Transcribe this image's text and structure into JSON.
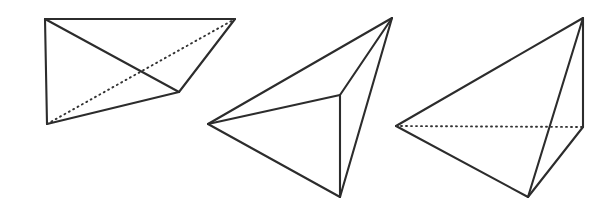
{
  "figure": {
    "caption": "",
    "background_color": "#ffffff",
    "stroke_color": "#2c2c2c",
    "solid_stroke_width": 2.1,
    "hidden_stroke_color": "#333333",
    "hidden_stroke_width": 1.9,
    "hidden_dash_pattern": "1 4",
    "canvas": {
      "width": 614,
      "height": 208
    },
    "shapes": [
      {
        "name": "tetrahedron-left",
        "label": "",
        "vertices": {
          "top_left": [
            45,
            19
          ],
          "top_right": [
            235,
            19
          ],
          "bottom_left": [
            47,
            124
          ],
          "inner_right": [
            179,
            92
          ]
        },
        "solid_edges": [
          [
            [
              45,
              19
            ],
            [
              235,
              19
            ]
          ],
          [
            [
              45,
              19
            ],
            [
              47,
              124
            ]
          ],
          [
            [
              47,
              124
            ],
            [
              179,
              92
            ]
          ],
          [
            [
              179,
              92
            ],
            [
              235,
              19
            ]
          ],
          [
            [
              45,
              19
            ],
            [
              179,
              92
            ]
          ]
        ],
        "hidden_edges": [
          [
            [
              47,
              124
            ],
            [
              235,
              19
            ]
          ]
        ],
        "gaps": []
      },
      {
        "name": "tetrahedron-middle",
        "label": "",
        "vertices": {
          "apex": [
            392,
            18
          ],
          "left": [
            208,
            124
          ],
          "bottom": [
            340,
            197
          ],
          "inner": [
            340,
            95
          ]
        },
        "solid_edges": [
          [
            [
              392,
              18
            ],
            [
              208,
              124
            ]
          ],
          [
            [
              208,
              124
            ],
            [
              340,
              197
            ]
          ],
          [
            [
              340,
              197
            ],
            [
              392,
              18
            ]
          ],
          [
            [
              392,
              18
            ],
            [
              340,
              95
            ]
          ],
          [
            [
              340,
              95
            ],
            [
              208,
              124
            ]
          ],
          [
            [
              340,
              95
            ],
            [
              340,
              197
            ]
          ]
        ],
        "hidden_edges": [],
        "gaps": [
          {
            "at": [
              301,
              165
            ],
            "width": 9,
            "angle": 29
          }
        ]
      },
      {
        "name": "tetrahedron-right",
        "label": "",
        "vertices": {
          "apex": [
            583,
            18
          ],
          "left": [
            396,
            126
          ],
          "bottom": [
            528,
            197
          ],
          "right": [
            583,
            127
          ]
        },
        "solid_edges": [
          [
            [
              583,
              18
            ],
            [
              396,
              126
            ]
          ],
          [
            [
              396,
              126
            ],
            [
              528,
              197
            ]
          ],
          [
            [
              528,
              197
            ],
            [
              583,
              18
            ]
          ],
          [
            [
              583,
              18
            ],
            [
              583,
              127
            ]
          ],
          [
            [
              583,
              127
            ],
            [
              528,
              197
            ]
          ]
        ],
        "hidden_edges": [
          [
            [
              396,
              126
            ],
            [
              583,
              127
            ]
          ]
        ],
        "gaps": [
          {
            "at": [
              456,
              171
            ],
            "width": 9,
            "angle": 28
          },
          {
            "at": [
              560,
              166
            ],
            "width": 9,
            "angle": 310
          }
        ]
      }
    ]
  }
}
